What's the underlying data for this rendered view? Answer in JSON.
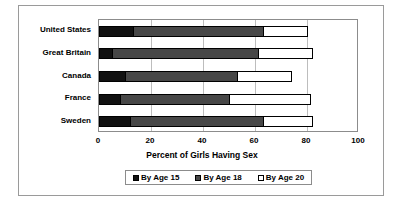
{
  "chart_data": {
    "type": "bar",
    "orientation": "horizontal",
    "stacked": true,
    "title": "",
    "xlabel": "Percent of Girls Having Sex",
    "ylabel": "",
    "xlim": [
      0,
      100
    ],
    "xticks": [
      "0",
      "20",
      "40",
      "60",
      "80",
      "100"
    ],
    "grid": true,
    "legend_position": "bottom",
    "categories": [
      "United States",
      "Great Britain",
      "Canada",
      "France",
      "Sweden"
    ],
    "series": [
      {
        "name": "By Age 15",
        "color": "#111111",
        "values": [
          13,
          5,
          10,
          8,
          12
        ]
      },
      {
        "name": "By Age 18",
        "color": "#474747",
        "values": [
          50,
          56,
          43,
          42,
          51
        ]
      },
      {
        "name": "By Age 20",
        "color": "#ffffff",
        "values": [
          17,
          21,
          21,
          31,
          19
        ]
      }
    ],
    "cumulative_totals": [
      {
        "category": "United States",
        "by_age_15": 13,
        "by_age_18": 63,
        "by_age_20": 80
      },
      {
        "category": "Great Britain",
        "by_age_15": 5,
        "by_age_18": 61,
        "by_age_20": 82
      },
      {
        "category": "Canada",
        "by_age_15": 10,
        "by_age_18": 53,
        "by_age_20": 74
      },
      {
        "category": "France",
        "by_age_15": 8,
        "by_age_18": 50,
        "by_age_20": 81
      },
      {
        "category": "Sweden",
        "by_age_15": 12,
        "by_age_18": 63,
        "by_age_20": 82
      }
    ]
  },
  "legend": {
    "items": [
      {
        "label": "By Age 15",
        "color": "#111111"
      },
      {
        "label": "By Age 18",
        "color": "#474747"
      },
      {
        "label": "By Age 20",
        "color": "#ffffff"
      }
    ]
  }
}
